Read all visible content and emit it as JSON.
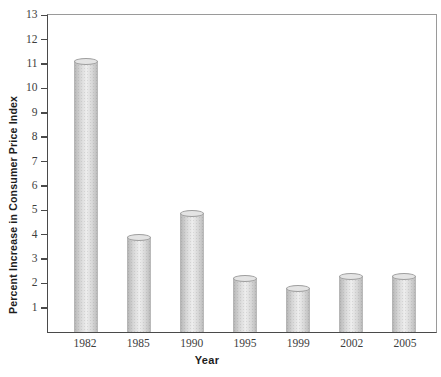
{
  "chart_data": {
    "type": "bar",
    "title": "",
    "categories": [
      "1982",
      "1985",
      "1990",
      "1995",
      "1999",
      "2002",
      "2005"
    ],
    "values": [
      11.1,
      3.9,
      4.9,
      2.2,
      1.8,
      2.3,
      2.3
    ],
    "xlabel": "Year",
    "ylabel": "Percent Increase in Consumer Price Index",
    "ylim": [
      0,
      13
    ],
    "yticks": [
      1,
      2,
      3,
      4,
      5,
      6,
      7,
      8,
      9,
      10,
      11,
      12,
      13
    ],
    "grid": false,
    "legend_position": "none",
    "bar_style": "cylinder-3d",
    "colors": {
      "bar_fill": "#d9d9d9",
      "bar_edge": "#9f9f9f",
      "axis": "#4a4a4a",
      "frame": "#9a9a9a",
      "text": "#3d3d3d"
    }
  }
}
